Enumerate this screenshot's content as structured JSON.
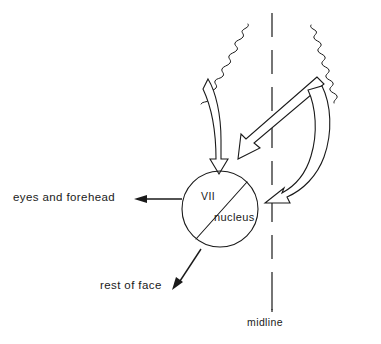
{
  "figure": {
    "background_color": "#ffffff",
    "line_color": "#1a1a1a"
  },
  "nucleus": {
    "upper_label": "VII",
    "lower_label": "nucleus",
    "center_x": 220,
    "center_y": 209,
    "radius": 38
  },
  "outputs": [
    {
      "id": "eyes-and-forehead",
      "label": "eyes and forehead"
    },
    {
      "id": "rest-of-face",
      "label": "rest of face"
    }
  ],
  "midline": {
    "label": "midline",
    "x": 272,
    "style": "dashed"
  },
  "inputs": [
    {
      "id": "ipsilateral-corticobulbar-tract",
      "side": "left",
      "description": "wavy tract descending to VII nucleus"
    },
    {
      "id": "contralateral-crossing-tract",
      "side": "right",
      "description": "wavy tract crossing midline to VII nucleus"
    },
    {
      "id": "contralateral-direct-tract",
      "side": "right",
      "description": "wavy tract curving to right side of VII nucleus"
    }
  ]
}
